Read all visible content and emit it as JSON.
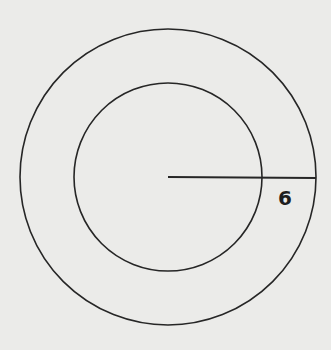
{
  "diagram": {
    "type": "concentric-circles",
    "background": "#ebebe9",
    "stroke_color": "#262626",
    "center": {
      "x": 168,
      "y": 177
    },
    "outer_circle": {
      "r": 148
    },
    "inner_circle": {
      "r": 94
    },
    "radius_segment": {
      "x1": 168,
      "y1": 177,
      "x2": 316,
      "y2": 178
    },
    "segment_label": "6",
    "label_position": {
      "x": 285,
      "y": 205
    }
  }
}
